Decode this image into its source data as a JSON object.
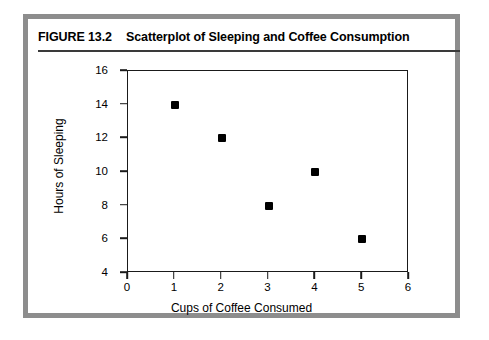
{
  "figure": {
    "tag": "FIGURE 13.2",
    "title": "Scatterplot of Sleeping and Coffee Consumption",
    "frame_color": "#8d8d8d",
    "background": "#ffffff"
  },
  "chart_data": {
    "type": "scatter",
    "title": "Scatterplot of Sleeping and Coffee Consumption",
    "xlabel": "Cups of Coffee Consumed",
    "ylabel": "Hours of Sleeping",
    "x": [
      1,
      2,
      3,
      4,
      5
    ],
    "y": [
      14,
      12,
      8,
      10,
      6
    ],
    "points": [
      {
        "x": 1,
        "y": 14
      },
      {
        "x": 2,
        "y": 12
      },
      {
        "x": 3,
        "y": 8
      },
      {
        "x": 4,
        "y": 10
      },
      {
        "x": 5,
        "y": 6
      }
    ],
    "xlim": [
      0,
      6
    ],
    "ylim": [
      4,
      16
    ],
    "xticks": [
      0,
      1,
      2,
      3,
      4,
      5,
      6
    ],
    "yticks": [
      4,
      6,
      8,
      10,
      12,
      14,
      16
    ],
    "xtick_labels": [
      "0",
      "1",
      "2",
      "3",
      "4",
      "5",
      "6"
    ],
    "ytick_labels": [
      "4",
      "6",
      "8",
      "10",
      "12",
      "14",
      "16"
    ],
    "grid": false,
    "legend": null,
    "marker": "filled-square",
    "marker_color": "#000000"
  }
}
